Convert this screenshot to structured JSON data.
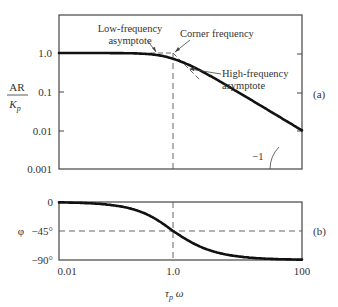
{
  "chart_data": [
    {
      "id": "a",
      "type": "line",
      "title": "Amplitude ratio (Bode magnitude, first-order process)",
      "panel_label": "(a)",
      "xlabel": "τp ω",
      "ylabel_num": "AR",
      "ylabel_den": "Kp",
      "xscale": "log",
      "yscale": "log",
      "xlim": [
        0.01,
        100
      ],
      "ylim": [
        0.001,
        1.0
      ],
      "yticks": [
        "1.0",
        "0.1",
        "0.01",
        "0.001"
      ],
      "ytick_values": [
        1.0,
        0.1,
        0.01,
        0.001
      ],
      "series": [
        {
          "name": "AR/Kp",
          "x": [
            0.01,
            0.03,
            0.1,
            0.2,
            0.3,
            0.5,
            0.7,
            1.0,
            1.5,
            2,
            3,
            5,
            10,
            30,
            100
          ],
          "y": [
            1.0,
            1.0,
            0.995,
            0.981,
            0.958,
            0.894,
            0.819,
            0.707,
            0.555,
            0.447,
            0.316,
            0.196,
            0.0995,
            0.0333,
            0.01
          ]
        }
      ],
      "asymptotes": [
        {
          "name": "Low-frequency asymptote",
          "x": [
            0.01,
            1.0
          ],
          "y": [
            1.0,
            1.0
          ]
        },
        {
          "name": "High-frequency asymptote",
          "x": [
            1.0,
            1.6
          ],
          "y": [
            1.0,
            0.62
          ]
        }
      ],
      "annotations": [
        {
          "text_lines": [
            "Low-frequency",
            "asymptote"
          ]
        },
        {
          "text_lines": [
            "Corner frequency"
          ]
        },
        {
          "text_lines": [
            "High-frequency",
            "asymptote"
          ]
        },
        {
          "text_lines": [
            "−1"
          ],
          "meaning": "slope of high-frequency asymptote"
        }
      ],
      "reference_lines": [
        {
          "orientation": "vertical",
          "x": 1.0,
          "style": "dashed"
        }
      ],
      "grid": false,
      "legend": "none"
    },
    {
      "id": "b",
      "type": "line",
      "title": "Phase angle (Bode phase, first-order process)",
      "panel_label": "(b)",
      "xlabel": "τp ω",
      "ylabel": "φ",
      "xscale": "log",
      "xlim": [
        0.01,
        100
      ],
      "ylim": [
        -90,
        0
      ],
      "xticks": [
        "0.01",
        "1.0",
        "100"
      ],
      "xtick_values": [
        0.01,
        1.0,
        100
      ],
      "yticks": [
        "0",
        "−45°",
        "−90°"
      ],
      "ytick_values": [
        0,
        -45,
        -90
      ],
      "series": [
        {
          "name": "φ",
          "x": [
            0.01,
            0.03,
            0.1,
            0.2,
            0.3,
            0.5,
            0.7,
            1.0,
            1.5,
            2,
            3,
            5,
            10,
            30,
            100
          ],
          "y": [
            -0.6,
            -1.7,
            -5.7,
            -11.3,
            -16.7,
            -26.6,
            -35.0,
            -45.0,
            -56.3,
            -63.4,
            -71.6,
            -78.7,
            -84.3,
            -88.1,
            -89.4
          ]
        }
      ],
      "reference_lines": [
        {
          "orientation": "vertical",
          "x": 1.0,
          "style": "dashed"
        },
        {
          "orientation": "horizontal",
          "y": -45,
          "style": "dashed"
        }
      ],
      "grid": false,
      "legend": "none"
    }
  ],
  "labels": {
    "ar": "AR",
    "kp": "K",
    "kp_sub": "p",
    "phi": "φ",
    "x_tau": "τ",
    "x_sub": "p",
    "x_omega": " ω",
    "panel_a": "(a)",
    "panel_b": "(b)",
    "low_freq_1": "Low-frequency",
    "low_freq_2": "asymptote",
    "corner": "Corner frequency",
    "high_freq_1": "High-frequency",
    "high_freq_2": "asymptote",
    "slope": "−1",
    "y_a": [
      "1.0",
      "0.1",
      "0.01",
      "0.001"
    ],
    "y_b": [
      "0",
      "−45°",
      "−90°"
    ],
    "x_b": [
      "0.01",
      "1.0",
      "100"
    ]
  }
}
